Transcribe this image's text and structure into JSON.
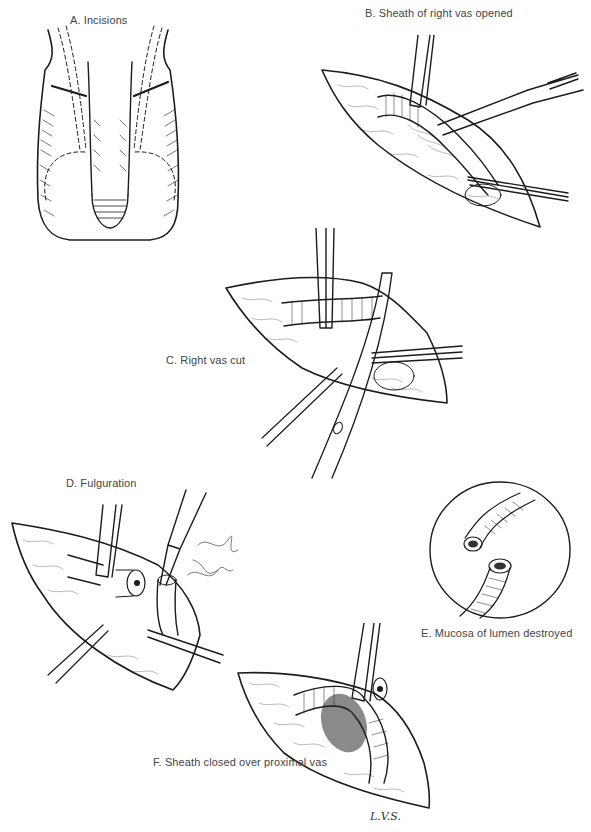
{
  "figure": {
    "panels": [
      {
        "id": "A",
        "label": "A. Incisions"
      },
      {
        "id": "B",
        "label": "B. Sheath of right vas opened"
      },
      {
        "id": "C",
        "label": "C. Right vas cut"
      },
      {
        "id": "D",
        "label": "D. Fulguration"
      },
      {
        "id": "E",
        "label": "E. Mucosa of lumen destroyed"
      },
      {
        "id": "F",
        "label": "F. Sheath closed over proximal vas"
      }
    ],
    "signature": "L.V.S."
  }
}
